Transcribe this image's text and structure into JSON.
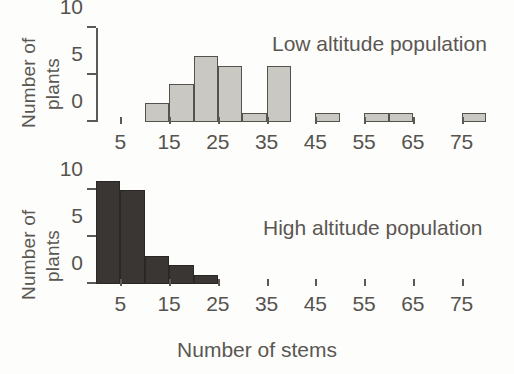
{
  "chart_data": [
    {
      "type": "bar",
      "title": "Low altitude population",
      "xlabel": "",
      "ylabel": "Number of plants",
      "ylim": [
        0,
        10
      ],
      "yticks": [
        0,
        5,
        10
      ],
      "ytick_labels": [
        "0",
        "5",
        "10"
      ],
      "xlim": [
        0,
        80
      ],
      "xticks": [
        5,
        15,
        25,
        35,
        45,
        55,
        65,
        75
      ],
      "xtick_labels": [
        "5",
        "15",
        "25",
        "35",
        "45",
        "55",
        "65",
        "75"
      ],
      "bin_width": 5,
      "bin_starts": [
        0,
        5,
        10,
        15,
        20,
        25,
        30,
        35,
        40,
        45,
        50,
        55,
        60,
        65,
        70,
        75
      ],
      "values": [
        0,
        0,
        2,
        4,
        7,
        6,
        1,
        6,
        0,
        1,
        0,
        1,
        1,
        0,
        0,
        1
      ],
      "bar_color": "#c9c8c2",
      "bar_edge_color": "#55524e",
      "grid": false,
      "legend": "none"
    },
    {
      "type": "bar",
      "title": "High altitude population",
      "xlabel": "Number of stems",
      "ylabel": "Number of plants",
      "ylim": [
        0,
        11
      ],
      "yticks": [
        0,
        5,
        10
      ],
      "ytick_labels": [
        "0",
        "5",
        "10"
      ],
      "xlim": [
        0,
        80
      ],
      "xticks": [
        5,
        15,
        25,
        35,
        45,
        55,
        65,
        75
      ],
      "xtick_labels": [
        "5",
        "15",
        "25",
        "35",
        "45",
        "55",
        "65",
        "75"
      ],
      "bin_width": 5,
      "bin_starts": [
        0,
        5,
        10,
        15,
        20,
        25,
        30,
        35,
        40,
        45,
        50,
        55,
        60,
        65,
        70,
        75
      ],
      "values": [
        11,
        10,
        3,
        2,
        1,
        0,
        0,
        0,
        0,
        0,
        0,
        0,
        0,
        0,
        0,
        0
      ],
      "bar_color": "#3a3634",
      "bar_edge_color": "#2a2724",
      "grid": false,
      "legend": "none"
    }
  ],
  "axes": {
    "y_title_line1": "Number of",
    "y_title_line2": "plants",
    "x_title": "Number of stems"
  },
  "panels": {
    "top_label": "Low altitude population",
    "bottom_label": "High altitude population"
  }
}
